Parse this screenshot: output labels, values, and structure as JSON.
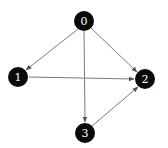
{
  "diagram": {
    "type": "directed-graph",
    "colors": {
      "node_fill": "#0a0a0a",
      "node_text": "#ffffff",
      "edge": "#7a7a7a",
      "arrow": "#555555",
      "background": "#ffffff"
    },
    "nodes": [
      {
        "id": "0",
        "label": "0",
        "x": 84,
        "y": 21
      },
      {
        "id": "1",
        "label": "1",
        "x": 18,
        "y": 77
      },
      {
        "id": "2",
        "label": "2",
        "x": 145,
        "y": 79
      },
      {
        "id": "3",
        "label": "3",
        "x": 85,
        "y": 133
      }
    ],
    "edges": [
      {
        "from": "0",
        "to": "1"
      },
      {
        "from": "0",
        "to": "2"
      },
      {
        "from": "0",
        "to": "3"
      },
      {
        "from": "1",
        "to": "2"
      },
      {
        "from": "3",
        "to": "2"
      }
    ]
  }
}
